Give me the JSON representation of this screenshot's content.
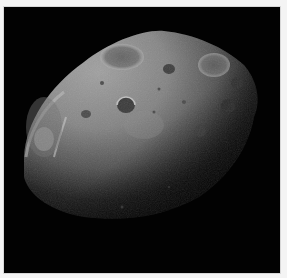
{
  "image": {
    "subject": "Phobos (moon of Mars) — cratered irregular body, lit from upper left",
    "caption_text": "",
    "background_color": "#020202",
    "frame_border_color": "#d8d8d8",
    "page_color": "#f4f4f4"
  },
  "moon": {
    "lit_color": "#9c9c9c",
    "highlight_color": "#c8c8c8",
    "shadow_color": "#0a0a0a",
    "craters": [
      {
        "cx": 118,
        "cy": 50,
        "rx": 22,
        "ry": 13
      },
      {
        "cx": 165,
        "cy": 62,
        "rx": 6,
        "ry": 5
      },
      {
        "cx": 210,
        "cy": 58,
        "rx": 16,
        "ry": 12
      },
      {
        "cx": 122,
        "cy": 98,
        "rx": 9,
        "ry": 8
      },
      {
        "cx": 233,
        "cy": 76,
        "rx": 6,
        "ry": 6
      },
      {
        "cx": 224,
        "cy": 99,
        "rx": 7,
        "ry": 7
      },
      {
        "cx": 40,
        "cy": 132,
        "rx": 10,
        "ry": 12
      },
      {
        "cx": 82,
        "cy": 107,
        "rx": 5,
        "ry": 4
      },
      {
        "cx": 196,
        "cy": 124,
        "rx": 6,
        "ry": 6
      }
    ]
  }
}
